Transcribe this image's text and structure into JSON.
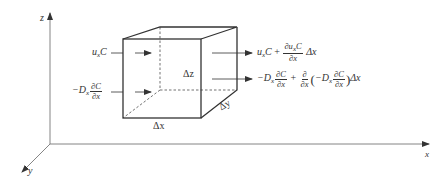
{
  "diagram": {
    "type": "control-volume-advection-diffusion",
    "axes": {
      "x_label": "x",
      "y_label": "y",
      "z_label": "z"
    },
    "cube": {
      "dx_label": "Δx",
      "dy_label": "Δy",
      "dz_label": "Δz"
    },
    "inflow": {
      "advective": {
        "base": "u",
        "sub": "x",
        "tail": "C"
      },
      "diffusive": {
        "prefix": "−D",
        "sub": "x",
        "num": "∂C",
        "den": "∂x"
      }
    },
    "outflow": {
      "advective": {
        "base": "u",
        "sub": "x",
        "tail": "C",
        "plus": "+",
        "num": "∂u",
        "num_sub": "x",
        "num_tail": "C",
        "den": "∂x",
        "suffix": "Δx"
      },
      "diffusive": {
        "prefix": "−D",
        "sub": "x",
        "num": "∂C",
        "den": "∂x",
        "plus": "+",
        "op_num": "∂",
        "op_den": "∂x",
        "lparen": "(",
        "inner_prefix": "−D",
        "inner_sub": "x",
        "inner_num": "∂C",
        "inner_den": "∂x",
        "rparen": ")",
        "suffix": "Δx"
      }
    },
    "colors": {
      "line": "#333333",
      "axis": "#555555",
      "background": "#ffffff"
    }
  }
}
